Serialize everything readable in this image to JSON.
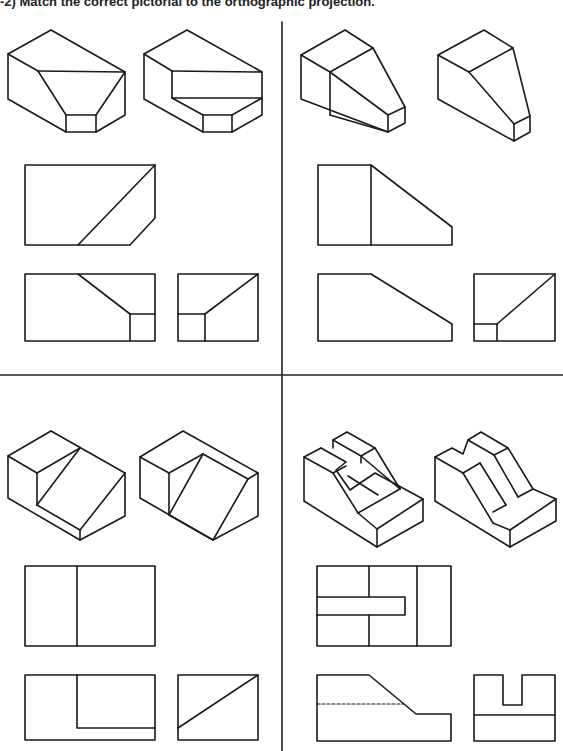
{
  "page": {
    "title": "-2)  Match the correct pictorial to the orthographic projection."
  },
  "problems": [
    {
      "id": "top-left",
      "pictorials": [
        "pictorial-a",
        "pictorial-b"
      ],
      "views": [
        "top-view",
        "front-view",
        "right-side-view"
      ]
    },
    {
      "id": "top-right",
      "pictorials": [
        "pictorial-a",
        "pictorial-b"
      ],
      "views": [
        "top-view",
        "front-view",
        "right-side-view"
      ]
    },
    {
      "id": "bottom-left",
      "pictorials": [
        "pictorial-a",
        "pictorial-b"
      ],
      "views": [
        "top-view",
        "front-view",
        "right-side-view"
      ]
    },
    {
      "id": "bottom-right",
      "pictorials": [
        "pictorial-a",
        "pictorial-b"
      ],
      "views": [
        "top-view",
        "front-view",
        "right-side-view"
      ],
      "front_view_has_hidden_line": true
    }
  ],
  "colors": {
    "line": "#1a1a1a",
    "background": "#ffffff"
  }
}
